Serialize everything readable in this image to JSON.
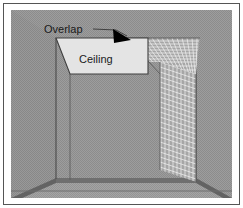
{
  "figure": {
    "name": "room-corner-overlap-diagram",
    "type": "architectural-perspective-diagram",
    "annotations": {
      "overlap_label": "Overlap",
      "ceiling_label": "Ceiling"
    },
    "colors": {
      "background": "#ffffff",
      "wall_gray": "#9a9a9a",
      "wall_gray_dither_dark": "#8e8e8e",
      "floor_gray": "#a2a2a2",
      "baseboard_dark": "#6b6b6b",
      "ceiling_fill": "#e2e2e2",
      "mesh_line": "#f2f2f2",
      "outline": "#3a3a3a",
      "arrow_fill": "#000000",
      "border": "#555555",
      "text": "#1a1a1a"
    },
    "geometry": {
      "frame": {
        "x": 3,
        "y": 3,
        "width": 237,
        "height": 202
      },
      "scene": {
        "x": 11,
        "y": 10,
        "width": 221,
        "height": 188
      },
      "left_wall_corner_x": 56,
      "back_wall_right_x": 196,
      "floor_line_y": 182,
      "horizon_y": 191,
      "ceiling_top_y": 38,
      "mesh_top_y": 38,
      "mesh_left_x": 127,
      "mesh_right_x": 200
    },
    "mesh": {
      "name": "wireframe-overlap-mesh",
      "ceiling_columns": 14,
      "ceiling_rows": 9,
      "wall_columns": 9,
      "wall_rows": 22
    }
  }
}
